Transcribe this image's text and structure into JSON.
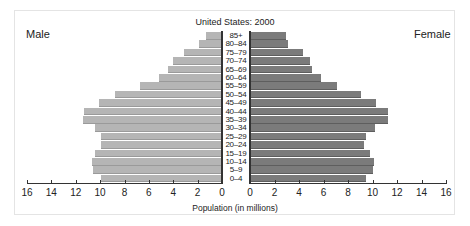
{
  "chart_data": {
    "type": "bar",
    "subtype": "population-pyramid",
    "title": "United States: 2000",
    "xlabel": "Population (in millions)",
    "ylabel": "",
    "xlim": [
      0,
      16
    ],
    "x_ticks": [
      0,
      2,
      4,
      6,
      8,
      10,
      12,
      14,
      16
    ],
    "grid": false,
    "legend": [
      "Male",
      "Female"
    ],
    "categories": [
      "85+",
      "80–84",
      "75–79",
      "70–74",
      "65–69",
      "60–64",
      "55–59",
      "50–54",
      "45–49",
      "40–44",
      "35–39",
      "30–34",
      "25–29",
      "20–24",
      "15–19",
      "10–14",
      "5–9",
      "0–4"
    ],
    "series": [
      {
        "name": "Male",
        "color": "#b5b5b5",
        "values": [
          1.3,
          1.9,
          3.1,
          4.0,
          4.4,
          5.2,
          6.7,
          8.8,
          10.1,
          11.3,
          11.4,
          10.4,
          9.9,
          9.9,
          10.4,
          10.7,
          10.6,
          9.9
        ]
      },
      {
        "name": "Female",
        "color": "#7b7b7b",
        "values": [
          2.9,
          3.1,
          4.3,
          4.9,
          5.1,
          5.8,
          7.1,
          9.1,
          10.3,
          11.3,
          11.3,
          10.2,
          9.5,
          9.3,
          9.8,
          10.1,
          10.0,
          9.5
        ]
      }
    ]
  },
  "labels": {
    "title": "United States: 2000",
    "male": "Male",
    "female": "Female",
    "xlabel": "Population (in millions)"
  }
}
